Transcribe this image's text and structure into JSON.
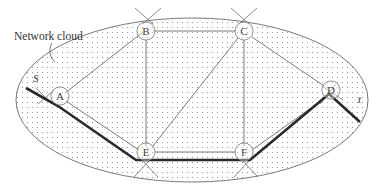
{
  "diagram": {
    "cloud_label": "Network cloud",
    "source_label": "S",
    "target_label": "t",
    "nodes": [
      {
        "id": "A",
        "label": "A"
      },
      {
        "id": "B",
        "label": "B"
      },
      {
        "id": "C",
        "label": "C"
      },
      {
        "id": "D",
        "label": "D"
      },
      {
        "id": "E",
        "label": "E"
      },
      {
        "id": "F",
        "label": "F"
      }
    ],
    "edges": [
      [
        "A",
        "B"
      ],
      [
        "B",
        "C"
      ],
      [
        "C",
        "D"
      ],
      [
        "B",
        "E"
      ],
      [
        "C",
        "F"
      ],
      [
        "C",
        "E"
      ],
      [
        "E",
        "F"
      ],
      [
        "A",
        "E"
      ],
      [
        "F",
        "D"
      ]
    ],
    "highlighted_path": [
      "S",
      "A",
      "E",
      "F",
      "D",
      "t"
    ],
    "colors": {
      "cloud_fill_dots": "#9a9a9a",
      "outline": "#7a7a7a",
      "path": "#2a2a2a"
    }
  }
}
